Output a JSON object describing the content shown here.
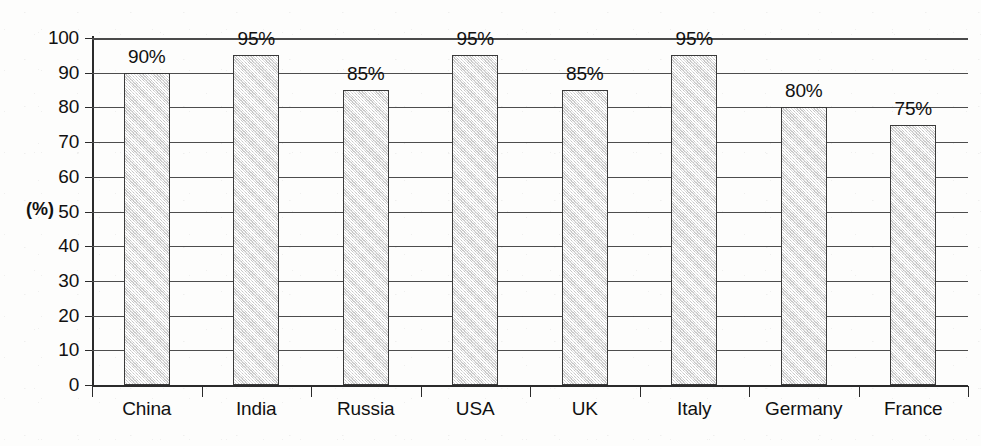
{
  "chart_data": {
    "type": "bar",
    "title": "",
    "xlabel": "",
    "ylabel": "(%)",
    "ylim": [
      0,
      100
    ],
    "ytick_step": 10,
    "yticks": [
      0,
      10,
      20,
      30,
      40,
      50,
      60,
      70,
      80,
      90,
      100
    ],
    "grid": true,
    "legend": "none",
    "categories": [
      "China",
      "India",
      "Russia",
      "USA",
      "UK",
      "Italy",
      "Germany",
      "France"
    ],
    "values": [
      90,
      95,
      85,
      95,
      85,
      95,
      80,
      75
    ],
    "data_labels": [
      "90%",
      "95%",
      "85%",
      "95%",
      "85%",
      "95%",
      "80%",
      "75%"
    ],
    "bar_fill_color": "#dcdcdc",
    "bar_border_color": "#3a3a3a",
    "axis_color": "#2b2b2b",
    "gridline_color": "#4d4d4d",
    "background_color": "#fdfdfc"
  }
}
